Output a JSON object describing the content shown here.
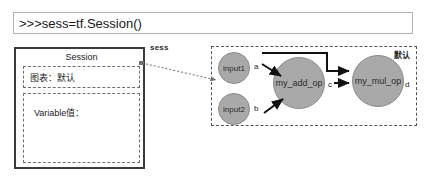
{
  "console": {
    "command": ">>>sess=tf.Session()"
  },
  "session_panel": {
    "title": "Session",
    "graph_field_label": "图表：默认",
    "variable_field_label": "Variable值："
  },
  "connector": {
    "label": "sess"
  },
  "graph_panel": {
    "tag": "默认",
    "nodes": [
      {
        "id": "input1",
        "label": "input1"
      },
      {
        "id": "input2",
        "label": "input2"
      },
      {
        "id": "my_add_op",
        "label": "my_add_op"
      },
      {
        "id": "my_mul_op",
        "label": "my_mul_op"
      }
    ],
    "edge_labels": {
      "a": "a",
      "b": "b",
      "c": "c",
      "d": "d"
    }
  },
  "colors": {
    "node_fill": "#a9a9a9",
    "node_stroke": "#8a8a8a",
    "panel_border": "#555555",
    "session_border": "#3c3c3c",
    "edge": "#111111"
  }
}
